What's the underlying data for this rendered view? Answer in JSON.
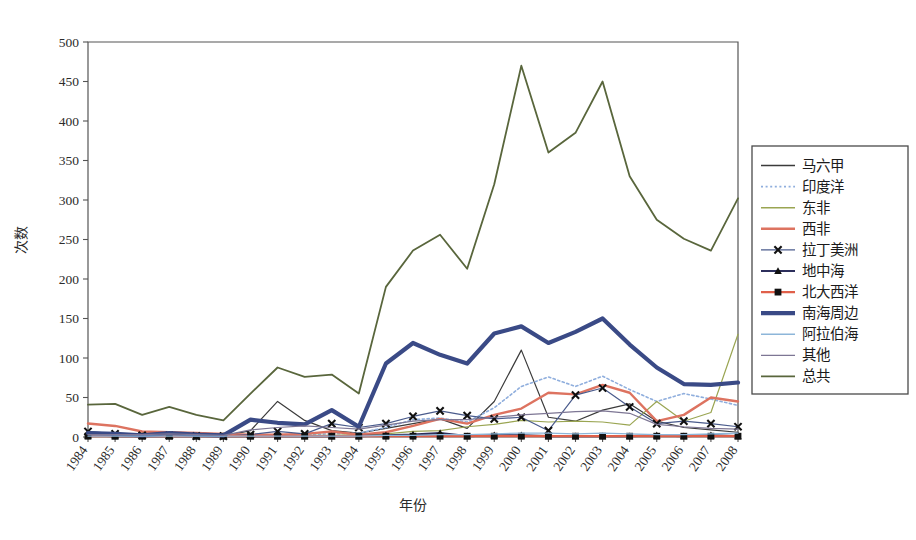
{
  "chart_data": {
    "type": "line",
    "title": "",
    "xlabel": "年份",
    "ylabel": "次数",
    "x": [
      1984,
      1985,
      1986,
      1987,
      1988,
      1989,
      1990,
      1991,
      1992,
      1993,
      1994,
      1995,
      1996,
      1997,
      1998,
      1999,
      2000,
      2001,
      2002,
      2003,
      2004,
      2005,
      2006,
      2007,
      2008
    ],
    "xtick_labels": [
      "1984",
      "1985",
      "1986",
      "1987",
      "1988",
      "1989",
      "1990",
      "1991",
      "1992",
      "1993",
      "1994",
      "1995",
      "1996",
      "1997",
      "1998",
      "1999",
      "2000",
      "2001",
      "2002",
      "2003",
      "2004",
      "2005",
      "2006",
      "2007",
      "2008"
    ],
    "ylim": [
      0,
      500
    ],
    "ytick_labels": [
      "0",
      "50",
      "100",
      "150",
      "200",
      "250",
      "300",
      "350",
      "400",
      "450",
      "500"
    ],
    "ytick_values": [
      0,
      50,
      100,
      150,
      200,
      250,
      300,
      350,
      400,
      450,
      500
    ],
    "grid": false,
    "legend_position": "right",
    "series": [
      {
        "name": "马六甲",
        "color": "#3b3b3b",
        "width": 1.2,
        "style": "solid",
        "marker": "none",
        "values": [
          4,
          3,
          2,
          3,
          2,
          1,
          8,
          45,
          21,
          8,
          5,
          11,
          17,
          23,
          11,
          45,
          110,
          25,
          20,
          34,
          42,
          20,
          12,
          9,
          6
        ]
      },
      {
        "name": "印度洋",
        "color": "#8faedd",
        "width": 1.6,
        "style": "dotted",
        "marker": "none",
        "values": [
          1,
          1,
          1,
          1,
          1,
          1,
          2,
          3,
          3,
          4,
          5,
          12,
          22,
          24,
          19,
          37,
          64,
          76,
          64,
          77,
          60,
          45,
          55,
          48,
          40
        ]
      },
      {
        "name": "东非",
        "color": "#9aa552",
        "width": 1.2,
        "style": "solid",
        "marker": "none",
        "values": [
          1,
          1,
          1,
          1,
          1,
          1,
          1,
          2,
          2,
          2,
          3,
          4,
          7,
          8,
          13,
          16,
          21,
          19,
          20,
          19,
          15,
          45,
          20,
          31,
          130
        ]
      },
      {
        "name": "西非",
        "color": "#dd7360",
        "width": 2.4,
        "style": "solid",
        "marker": "none",
        "values": [
          17,
          14,
          7,
          6,
          5,
          4,
          3,
          3,
          4,
          7,
          3,
          6,
          14,
          23,
          17,
          28,
          36,
          56,
          54,
          66,
          56,
          20,
          28,
          50,
          45
        ]
      },
      {
        "name": "拉丁美洲",
        "color": "#4a5b8c",
        "width": 1.2,
        "style": "solid",
        "marker": "x",
        "values": [
          7,
          4,
          2,
          2,
          1,
          1,
          3,
          7,
          4,
          17,
          12,
          17,
          26,
          33,
          27,
          23,
          25,
          8,
          53,
          62,
          38,
          17,
          20,
          17,
          13
        ]
      },
      {
        "name": "地中海",
        "color": "#2d2f5c",
        "width": 2.2,
        "style": "solid",
        "marker": "triangle",
        "values": [
          2,
          1,
          1,
          1,
          1,
          1,
          1,
          1,
          1,
          1,
          1,
          2,
          3,
          5,
          1,
          2,
          2,
          1,
          1,
          1,
          1,
          2,
          1,
          2,
          1
        ]
      },
      {
        "name": "北大西洋",
        "color": "#e0604a",
        "width": 2.2,
        "style": "solid",
        "marker": "square",
        "values": [
          1,
          1,
          1,
          1,
          1,
          1,
          1,
          1,
          1,
          1,
          1,
          1,
          1,
          1,
          1,
          1,
          1,
          1,
          1,
          1,
          1,
          1,
          1,
          1,
          1
        ]
      },
      {
        "name": "南海周边",
        "color": "#3a4a86",
        "width": 4.2,
        "style": "solid",
        "marker": "none",
        "values": [
          5,
          4,
          2,
          5,
          3,
          2,
          22,
          18,
          16,
          34,
          13,
          93,
          119,
          104,
          93,
          131,
          140,
          119,
          133,
          150,
          117,
          88,
          67,
          66,
          69
        ]
      },
      {
        "name": "阿拉伯海",
        "color": "#8db6d9",
        "width": 1.2,
        "style": "solid",
        "marker": "none",
        "values": [
          1,
          1,
          1,
          1,
          1,
          1,
          1,
          1,
          1,
          1,
          1,
          2,
          2,
          3,
          3,
          4,
          5,
          5,
          4,
          5,
          4,
          3,
          3,
          4,
          5
        ]
      },
      {
        "name": "其他",
        "color": "#7d7694",
        "width": 1.2,
        "style": "solid",
        "marker": "none",
        "values": [
          3,
          3,
          3,
          4,
          3,
          2,
          9,
          12,
          14,
          12,
          10,
          15,
          20,
          22,
          22,
          25,
          28,
          30,
          32,
          33,
          30,
          16,
          13,
          11,
          10
        ]
      },
      {
        "name": "总共",
        "color": "#59663c",
        "width": 1.8,
        "style": "solid",
        "marker": "none",
        "values": [
          41,
          42,
          28,
          38,
          28,
          21,
          55,
          88,
          76,
          79,
          55,
          190,
          236,
          256,
          213,
          320,
          470,
          360,
          385,
          450,
          330,
          275,
          251,
          236,
          302
        ]
      }
    ]
  },
  "axis": {
    "y_title": "次数",
    "x_title": "年份"
  }
}
